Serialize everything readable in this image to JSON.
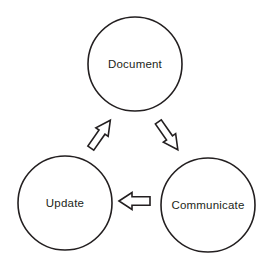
{
  "diagram": {
    "type": "cycle",
    "stroke_color": "#231f20",
    "fill_color": "#ffffff",
    "nodes": [
      {
        "id": "document",
        "label": "Document",
        "cx": 135,
        "cy": 64,
        "r": 47
      },
      {
        "id": "communicate",
        "label": "Communicate",
        "cx": 208,
        "cy": 205,
        "r": 47
      },
      {
        "id": "update",
        "label": "Update",
        "cx": 65,
        "cy": 203,
        "r": 47
      }
    ],
    "arrows": [
      {
        "id": "document-to-communicate",
        "from": "document",
        "to": "communicate",
        "direction": "down-right"
      },
      {
        "id": "communicate-to-update",
        "from": "communicate",
        "to": "update",
        "direction": "left"
      },
      {
        "id": "update-to-document",
        "from": "update",
        "to": "document",
        "direction": "up-right"
      }
    ]
  }
}
